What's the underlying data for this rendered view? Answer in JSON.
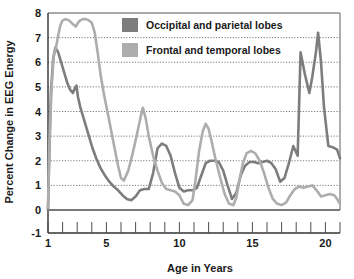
{
  "chart_data": {
    "type": "line",
    "title": "",
    "xlabel": "Age in Years",
    "ylabel": "Percent Change in EEG Energy",
    "xlim": [
      1,
      21
    ],
    "ylim": [
      -1,
      8
    ],
    "xticks": [
      1,
      5,
      10,
      15,
      20
    ],
    "xtick_labels": [
      "1",
      "5",
      "10",
      "15",
      "20"
    ],
    "xminor_ticks": [
      1,
      2,
      3,
      4,
      5,
      6,
      7,
      8,
      9,
      10,
      11,
      12,
      13,
      14,
      15,
      16,
      17,
      18,
      19,
      20,
      21
    ],
    "yticks": [
      -1,
      0,
      1,
      2,
      3,
      4,
      5,
      6,
      7,
      8
    ],
    "ytick_labels": [
      "-1",
      "0",
      "1",
      "2",
      "3",
      "4",
      "5",
      "6",
      "7",
      "8"
    ],
    "grid": true,
    "grid_style": "dotted-horizontal",
    "legend_position": "top-center",
    "series": [
      {
        "name": "Occipital and parietal lobes",
        "color": "#7d7d7d",
        "x": [
          1.0,
          1.1,
          1.2,
          1.35,
          1.5,
          1.7,
          1.9,
          2.1,
          2.3,
          2.5,
          2.7,
          2.85,
          2.95,
          3.05,
          3.2,
          3.4,
          3.7,
          4.0,
          4.3,
          4.6,
          4.9,
          5.2,
          5.5,
          5.8,
          6.1,
          6.4,
          6.7,
          7.0,
          7.3,
          7.6,
          7.9,
          8.2,
          8.5,
          8.8,
          9.1,
          9.4,
          9.7,
          10.0,
          10.3,
          10.6,
          10.9,
          11.2,
          11.5,
          11.8,
          12.1,
          12.4,
          12.7,
          13.0,
          13.3,
          13.6,
          13.9,
          14.2,
          14.5,
          14.8,
          15.1,
          15.4,
          15.7,
          16.0,
          16.3,
          16.6,
          16.9,
          17.2,
          17.5,
          17.8,
          18.1,
          18.3,
          18.6,
          18.9,
          19.1,
          19.35,
          19.5,
          19.7,
          19.9,
          20.2,
          20.5,
          20.8,
          21.0
        ],
        "y": [
          0.0,
          2.5,
          4.8,
          6.1,
          6.6,
          6.4,
          6.0,
          5.6,
          5.2,
          4.9,
          4.75,
          4.95,
          5.05,
          4.6,
          4.2,
          3.8,
          3.2,
          2.6,
          2.1,
          1.7,
          1.4,
          1.15,
          0.95,
          0.8,
          0.6,
          0.45,
          0.4,
          0.55,
          0.8,
          0.85,
          0.85,
          1.5,
          2.5,
          2.7,
          2.6,
          2.2,
          1.5,
          0.9,
          0.75,
          0.8,
          0.8,
          0.9,
          1.4,
          1.9,
          2.0,
          2.0,
          1.95,
          1.6,
          1.0,
          0.45,
          0.7,
          1.4,
          1.8,
          1.95,
          1.95,
          1.9,
          1.95,
          2.0,
          1.9,
          1.65,
          1.15,
          1.3,
          1.9,
          2.6,
          2.2,
          6.4,
          5.5,
          4.75,
          5.4,
          6.4,
          7.2,
          6.0,
          4.2,
          2.6,
          2.55,
          2.45,
          2.1
        ]
      },
      {
        "name": "Frontal and temporal lobes",
        "color": "#adadad",
        "x": [
          1.0,
          1.1,
          1.25,
          1.4,
          1.55,
          1.7,
          1.85,
          2.0,
          2.2,
          2.45,
          2.7,
          2.9,
          3.05,
          3.2,
          3.4,
          3.6,
          3.8,
          4.0,
          4.2,
          4.4,
          4.6,
          4.8,
          5.0,
          5.2,
          5.4,
          5.6,
          5.8,
          6.0,
          6.2,
          6.5,
          6.8,
          7.1,
          7.35,
          7.5,
          7.7,
          7.9,
          8.2,
          8.5,
          8.8,
          9.1,
          9.4,
          9.7,
          10.0,
          10.3,
          10.6,
          10.9,
          11.1,
          11.35,
          11.6,
          11.8,
          12.0,
          12.2,
          12.5,
          12.8,
          13.1,
          13.4,
          13.7,
          13.9,
          14.1,
          14.35,
          14.6,
          14.9,
          15.2,
          15.5,
          15.8,
          16.1,
          16.4,
          16.7,
          17.0,
          17.3,
          17.6,
          17.9,
          18.2,
          18.5,
          18.8,
          19.1,
          19.4,
          19.7,
          20.0,
          20.3,
          20.6,
          20.8,
          21.0
        ],
        "y": [
          0.1,
          2.8,
          5.0,
          6.3,
          6.6,
          7.1,
          7.5,
          7.7,
          7.75,
          7.7,
          7.55,
          7.45,
          7.6,
          7.7,
          7.75,
          7.75,
          7.7,
          7.6,
          7.2,
          6.4,
          5.5,
          4.8,
          4.2,
          3.6,
          3.0,
          2.4,
          1.8,
          1.3,
          1.2,
          1.6,
          2.3,
          3.1,
          3.8,
          4.15,
          3.7,
          3.0,
          2.2,
          1.6,
          1.1,
          0.85,
          0.8,
          0.75,
          0.6,
          0.25,
          0.2,
          0.4,
          1.2,
          2.4,
          3.2,
          3.5,
          3.3,
          2.8,
          2.0,
          1.3,
          0.65,
          0.25,
          0.2,
          0.5,
          1.2,
          1.9,
          2.3,
          2.4,
          2.3,
          2.0,
          1.5,
          0.9,
          0.45,
          0.25,
          0.2,
          0.3,
          0.6,
          0.85,
          0.95,
          0.9,
          0.95,
          1.0,
          0.8,
          0.55,
          0.6,
          0.65,
          0.6,
          0.45,
          0.25
        ]
      }
    ]
  },
  "legend": {
    "items": [
      {
        "label": "Occipital and parietal lobes",
        "color": "#7d7d7d"
      },
      {
        "label": "Frontal and temporal lobes",
        "color": "#adadad"
      }
    ]
  },
  "axes": {
    "x_title": "Age in Years",
    "y_title": "Percent Change in EEG Energy"
  },
  "colors": {
    "dark_series": "#7d7d7d",
    "light_series": "#adadad",
    "axis": "#333333",
    "grid": "#555555",
    "text": "#1a1a1a",
    "background": "#ffffff"
  }
}
